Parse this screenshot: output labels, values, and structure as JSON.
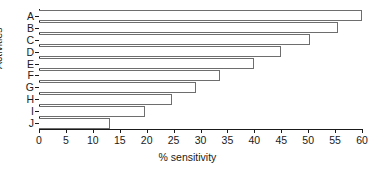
{
  "chart_data": {
    "type": "bar",
    "orientation": "horizontal",
    "title": "",
    "xlabel": "% sensitivity",
    "ylabel": "Activities",
    "categories": [
      "A",
      "B",
      "C",
      "D",
      "E",
      "F",
      "G",
      "H",
      "I",
      "J"
    ],
    "values": [
      60.0,
      55.6,
      50.3,
      45.0,
      40.0,
      33.7,
      29.2,
      24.7,
      19.6,
      13.2
    ],
    "xlim": [
      0,
      60
    ],
    "xticks": [
      0,
      5,
      10,
      15,
      20,
      25,
      30,
      35,
      40,
      45,
      50,
      55,
      60
    ],
    "xtick_labels": [
      "0",
      "5",
      "10",
      "15",
      "20",
      "25",
      "30",
      "35",
      "40",
      "45",
      "50",
      "55",
      "60"
    ],
    "grid": false,
    "legend": "none",
    "bar_fill_color": "#ffffff",
    "bar_edge_color": "#6e6e6e",
    "axis_color": "#1a1a1a",
    "background_color": "#ffffff"
  }
}
